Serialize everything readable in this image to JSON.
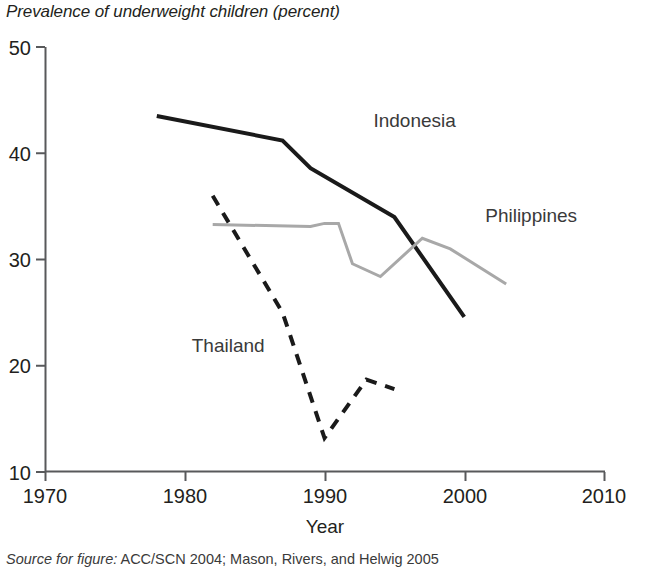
{
  "figure": {
    "title": "Prevalence of underweight children (percent)",
    "source_prefix": "Source for figure:",
    "source_text": "ACC/SCN 2004; Mason, Rivers, and Helwig 2005"
  },
  "chart_data": {
    "type": "line",
    "title": "Prevalence of underweight children (percent)",
    "xlabel": "Year",
    "ylabel": "",
    "xlim": [
      1970,
      2010
    ],
    "ylim": [
      10,
      50
    ],
    "xticks": [
      1970,
      1980,
      1990,
      2000,
      2010
    ],
    "yticks": [
      10,
      20,
      30,
      40,
      50
    ],
    "xtick_labels": [
      "1970",
      "1980",
      "1990",
      "2000",
      "2010"
    ],
    "ytick_labels": [
      "10",
      "20",
      "30",
      "40",
      "50"
    ],
    "grid": false,
    "legend": "inline-annotations",
    "series": [
      {
        "name": "Indonesia",
        "style": "solid",
        "color": "#1a1a1a",
        "width": 4,
        "label_x": 1993.5,
        "label_y": 42.5,
        "x": [
          1978,
          1987,
          1989,
          1995,
          2000
        ],
        "y": [
          43.5,
          41.2,
          38.6,
          34.0,
          24.6
        ]
      },
      {
        "name": "Philippines",
        "style": "solid",
        "color": "#a8a8a8",
        "width": 3,
        "label_x": 2001.5,
        "label_y": 33.5,
        "x": [
          1982,
          1989,
          1990,
          1991,
          1992,
          1994,
          1997,
          1999,
          2003
        ],
        "y": [
          33.3,
          33.1,
          33.4,
          33.4,
          29.6,
          28.4,
          32.0,
          31.0,
          27.7
        ]
      },
      {
        "name": "Thailand",
        "style": "dashed",
        "color": "#1a1a1a",
        "width": 4,
        "label_x": 1980.5,
        "label_y": 21.3,
        "x": [
          1982,
          1987,
          1990,
          1993,
          1995
        ],
        "y": [
          36.0,
          25.0,
          13.2,
          18.7,
          17.8
        ]
      }
    ]
  }
}
